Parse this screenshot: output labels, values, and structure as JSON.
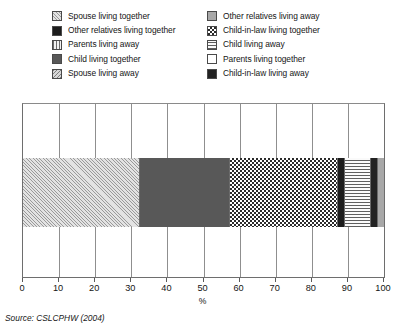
{
  "legend": {
    "columns": [
      {
        "items": [
          {
            "label": "Spouse living together",
            "pattern": "diagonal-hatch",
            "swatch_name": "legend-swatch-spouse-living-together"
          },
          {
            "label": "Other relatives living together",
            "pattern": "solid-black",
            "swatch_name": "legend-swatch-other-relatives-living-together"
          },
          {
            "label": "Parents living away",
            "pattern": "vertical-lines",
            "swatch_name": "legend-swatch-parents-living-away"
          },
          {
            "label": "Child living together",
            "pattern": "solid-mid-gray",
            "swatch_name": "legend-swatch-child-living-together"
          },
          {
            "label": "Spouse living away",
            "pattern": "diagonal-hatch-rev",
            "swatch_name": "legend-swatch-spouse-living-away"
          }
        ]
      },
      {
        "items": [
          {
            "label": "Other relatives living away",
            "pattern": "solid-gray",
            "swatch_name": "legend-swatch-other-relatives-living-away"
          },
          {
            "label": "Child-in-law living together",
            "pattern": "checkerboard",
            "swatch_name": "legend-swatch-child-in-law-living-together"
          },
          {
            "label": "Child living away",
            "pattern": "horizontal-lines",
            "swatch_name": "legend-swatch-child-living-away"
          },
          {
            "label": "Parents living together",
            "pattern": "white",
            "swatch_name": "legend-swatch-parents-living-together"
          },
          {
            "label": "Child-in-law living away",
            "pattern": "solid-dark",
            "swatch_name": "legend-swatch-child-in-law-living-away"
          }
        ]
      }
    ]
  },
  "axis": {
    "title": "%",
    "ticks": [
      "0",
      "10",
      "20",
      "30",
      "40",
      "50",
      "60",
      "70",
      "80",
      "90",
      "100"
    ]
  },
  "source": "Source: CSLCPHW (2004)",
  "chart_data": {
    "type": "bar",
    "orientation": "horizontal",
    "stacked": true,
    "title": "",
    "xlabel": "%",
    "ylabel": "",
    "xlim": [
      0,
      100
    ],
    "grid": true,
    "legend_position": "top",
    "categories": [
      "All"
    ],
    "series": [
      {
        "name": "Spouse living together",
        "values": [
          32
        ],
        "pattern": "diagonal-hatch"
      },
      {
        "name": "Child living together",
        "values": [
          25
        ],
        "pattern": "solid-mid-gray"
      },
      {
        "name": "Child-in-law living together",
        "values": [
          30
        ],
        "pattern": "checkerboard"
      },
      {
        "name": "Other relatives living together",
        "values": [
          2
        ],
        "pattern": "solid-black"
      },
      {
        "name": "Parents living together",
        "values": [
          7
        ],
        "pattern": "horizontal-lines"
      },
      {
        "name": "Child-in-law living away",
        "values": [
          2
        ],
        "pattern": "solid-dark"
      },
      {
        "name": "Other relatives living away",
        "values": [
          2
        ],
        "pattern": "solid-gray"
      }
    ],
    "segments": [
      {
        "label": "Spouse living together",
        "value": 32,
        "start": 0,
        "end": 32,
        "pattern": "diagonal-hatch"
      },
      {
        "label": "Child living together",
        "value": 25,
        "start": 32,
        "end": 57,
        "pattern": "solid-mid-gray"
      },
      {
        "label": "Child-in-law living together",
        "value": 30,
        "start": 57,
        "end": 87,
        "pattern": "checkerboard"
      },
      {
        "label": "Other relatives living together",
        "value": 2,
        "start": 87,
        "end": 89,
        "pattern": "solid-black"
      },
      {
        "label": "Parents living together",
        "value": 7,
        "start": 89,
        "end": 96,
        "pattern": "horizontal-lines"
      },
      {
        "label": "Child-in-law living away",
        "value": 2,
        "start": 96,
        "end": 98,
        "pattern": "solid-dark"
      },
      {
        "label": "Other relatives living away",
        "value": 2,
        "start": 98,
        "end": 100,
        "pattern": "solid-gray"
      }
    ]
  }
}
